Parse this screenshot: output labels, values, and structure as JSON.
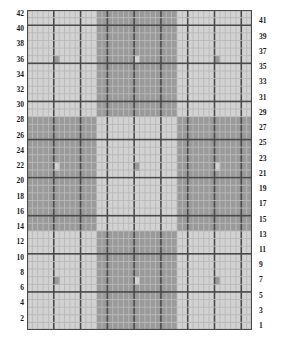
{
  "chart_data": {
    "type": "heatmap",
    "title": "",
    "xlabel": "",
    "ylabel": "",
    "grid": true,
    "legend_position": "none",
    "columns": 42,
    "rows": 42,
    "xlim": [
      1,
      42
    ],
    "ylim": [
      1,
      42
    ],
    "row_labels_left": [
      42,
      40,
      38,
      36,
      34,
      32,
      30,
      28,
      26,
      24,
      22,
      20,
      18,
      16,
      14,
      12,
      10,
      8,
      6,
      4,
      2
    ],
    "row_labels_right": [
      41,
      39,
      37,
      35,
      33,
      31,
      29,
      27,
      25,
      23,
      21,
      19,
      17,
      15,
      13,
      11,
      9,
      7,
      5,
      3,
      1
    ],
    "colors": {
      "light": "#d2d2d2",
      "dark": "#9a9a9a",
      "accent_on_light": "#9a9a9a",
      "accent_on_dark": "#d2d2d2",
      "minor_gridline": "#b9b9b9",
      "major_gridline": "#4a4a4a",
      "background": "#ffffff",
      "label_text": "#1a1a1a"
    },
    "block_structure": {
      "description": "3x3 checkerboard of alternating light and dark blocks",
      "col_breaks": [
        0,
        13,
        28,
        42
      ],
      "row_breaks": [
        0,
        14,
        29,
        42
      ],
      "block_fills": [
        [
          "light",
          "dark",
          "light"
        ],
        [
          "dark",
          "light",
          "dark"
        ],
        [
          "light",
          "dark",
          "light"
        ]
      ]
    },
    "accent_cells": [
      {
        "col": 6,
        "row": 7,
        "fill": "accent_on_light"
      },
      {
        "col": 21,
        "row": 7,
        "fill": "accent_on_dark"
      },
      {
        "col": 36,
        "row": 7,
        "fill": "accent_on_light"
      },
      {
        "col": 6,
        "row": 22,
        "fill": "accent_on_dark"
      },
      {
        "col": 21,
        "row": 22,
        "fill": "accent_on_light"
      },
      {
        "col": 36,
        "row": 22,
        "fill": "accent_on_dark"
      },
      {
        "col": 6,
        "row": 36,
        "fill": "accent_on_light"
      },
      {
        "col": 21,
        "row": 36,
        "fill": "accent_on_dark"
      },
      {
        "col": 36,
        "row": 36,
        "fill": "accent_on_light"
      }
    ],
    "gridline_major_every": 5
  }
}
